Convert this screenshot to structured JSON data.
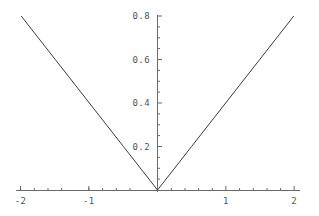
{
  "chart_data": {
    "type": "line",
    "title": "",
    "subtitle": "",
    "xlabel": "",
    "ylabel": "",
    "xlim": [
      -2.05,
      2.05
    ],
    "ylim": [
      0,
      0.83
    ],
    "grid": false,
    "legend": null,
    "axis_style": "mathematica-cross-axes",
    "x_ticks_major": [
      -2,
      -1,
      1,
      2
    ],
    "x_tick_labels": [
      "-2",
      "-1",
      "1",
      "2"
    ],
    "x_ticks_minor": [
      -1.8,
      -1.6,
      -1.4,
      -1.2,
      -0.8,
      -0.6,
      -0.4,
      -0.2,
      0.2,
      0.4,
      0.6,
      0.8,
      1.2,
      1.4,
      1.6,
      1.8
    ],
    "y_ticks_major": [
      0.2,
      0.4,
      0.6,
      0.8
    ],
    "y_tick_labels": [
      "0.2",
      "0.4",
      "0.6",
      "0.8"
    ],
    "y_ticks_minor": [
      0.05,
      0.1,
      0.15,
      0.25,
      0.3,
      0.35,
      0.45,
      0.5,
      0.55,
      0.65,
      0.7,
      0.75
    ],
    "series": [
      {
        "name": "0.4*abs(x)",
        "color": "#3c3c3c",
        "x": [
          -2,
          -1.5,
          -1,
          -0.5,
          0,
          0.5,
          1,
          1.5,
          2
        ],
        "values": [
          0.8,
          0.6,
          0.4,
          0.2,
          0,
          0.2,
          0.4,
          0.6,
          0.8
        ]
      }
    ],
    "annotations": []
  },
  "colors": {
    "background": "#ffffff",
    "axis": "#6b6b6b",
    "curve": "#3c3c3c",
    "tick_label": "#555555"
  }
}
